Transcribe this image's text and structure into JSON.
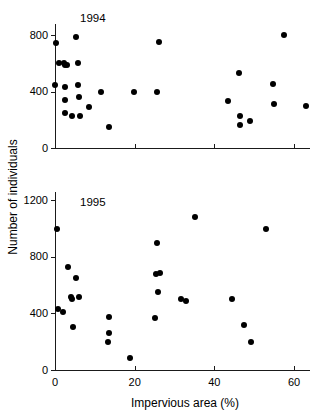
{
  "figure": {
    "x_axis_title": "Impervious area (%)",
    "y_axis_title": "Number of individuals"
  },
  "chart_data": {
    "type": "scatter",
    "title": "",
    "xlabel": "Impervious area (%)",
    "ylabel": "Number of individuals",
    "grid": false,
    "legend": "none",
    "panels": [
      {
        "label": "1994",
        "xlim": [
          0,
          64
        ],
        "ylim": [
          0,
          880
        ],
        "xticks": [
          0,
          20,
          40,
          60
        ],
        "xticklabels": [
          "",
          "",
          "",
          ""
        ],
        "yticks": [
          0,
          400,
          800
        ],
        "yticklabels": [
          "0",
          "400",
          "800"
        ],
        "points": [
          {
            "x": 0.3,
            "y": 745
          },
          {
            "x": 0.0,
            "y": 450
          },
          {
            "x": 1.0,
            "y": 605
          },
          {
            "x": 2.2,
            "y": 600
          },
          {
            "x": 2.6,
            "y": 590
          },
          {
            "x": 2.9,
            "y": 590
          },
          {
            "x": 2.4,
            "y": 435
          },
          {
            "x": 2.4,
            "y": 340
          },
          {
            "x": 2.6,
            "y": 245
          },
          {
            "x": 4.2,
            "y": 225
          },
          {
            "x": 5.2,
            "y": 785
          },
          {
            "x": 5.7,
            "y": 600
          },
          {
            "x": 5.7,
            "y": 450
          },
          {
            "x": 6.0,
            "y": 365
          },
          {
            "x": 6.2,
            "y": 230
          },
          {
            "x": 8.5,
            "y": 290
          },
          {
            "x": 11.5,
            "y": 395
          },
          {
            "x": 13.5,
            "y": 150
          },
          {
            "x": 19.8,
            "y": 395
          },
          {
            "x": 25.5,
            "y": 400
          },
          {
            "x": 26.2,
            "y": 750
          },
          {
            "x": 43.5,
            "y": 335
          },
          {
            "x": 46.2,
            "y": 530
          },
          {
            "x": 46.5,
            "y": 230
          },
          {
            "x": 46.4,
            "y": 165
          },
          {
            "x": 49.0,
            "y": 195
          },
          {
            "x": 54.8,
            "y": 455
          },
          {
            "x": 55.0,
            "y": 315
          },
          {
            "x": 57.4,
            "y": 805
          },
          {
            "x": 62.9,
            "y": 300
          }
        ]
      },
      {
        "label": "1995",
        "xlim": [
          0,
          64
        ],
        "ylim": [
          0,
          1260
        ],
        "xticks": [
          0,
          20,
          40,
          60
        ],
        "xticklabels": [
          "0",
          "20",
          "40",
          "60"
        ],
        "yticks": [
          0,
          400,
          800,
          1200
        ],
        "yticklabels": [
          "0",
          "400",
          "800",
          "1200"
        ],
        "points": [
          {
            "x": 0.6,
            "y": 1000
          },
          {
            "x": 0.8,
            "y": 435
          },
          {
            "x": 2.0,
            "y": 410
          },
          {
            "x": 3.3,
            "y": 730
          },
          {
            "x": 3.9,
            "y": 520
          },
          {
            "x": 4.2,
            "y": 505
          },
          {
            "x": 4.4,
            "y": 305
          },
          {
            "x": 5.2,
            "y": 650
          },
          {
            "x": 6.0,
            "y": 520
          },
          {
            "x": 13.5,
            "y": 375
          },
          {
            "x": 13.6,
            "y": 265
          },
          {
            "x": 13.4,
            "y": 200
          },
          {
            "x": 18.8,
            "y": 85
          },
          {
            "x": 25.2,
            "y": 365
          },
          {
            "x": 25.4,
            "y": 680
          },
          {
            "x": 26.3,
            "y": 690
          },
          {
            "x": 25.6,
            "y": 900
          },
          {
            "x": 25.8,
            "y": 555
          },
          {
            "x": 31.5,
            "y": 500
          },
          {
            "x": 32.9,
            "y": 485
          },
          {
            "x": 35.2,
            "y": 1080
          },
          {
            "x": 44.5,
            "y": 500
          },
          {
            "x": 47.5,
            "y": 320
          },
          {
            "x": 49.2,
            "y": 200
          },
          {
            "x": 53.0,
            "y": 1000
          }
        ]
      }
    ]
  }
}
